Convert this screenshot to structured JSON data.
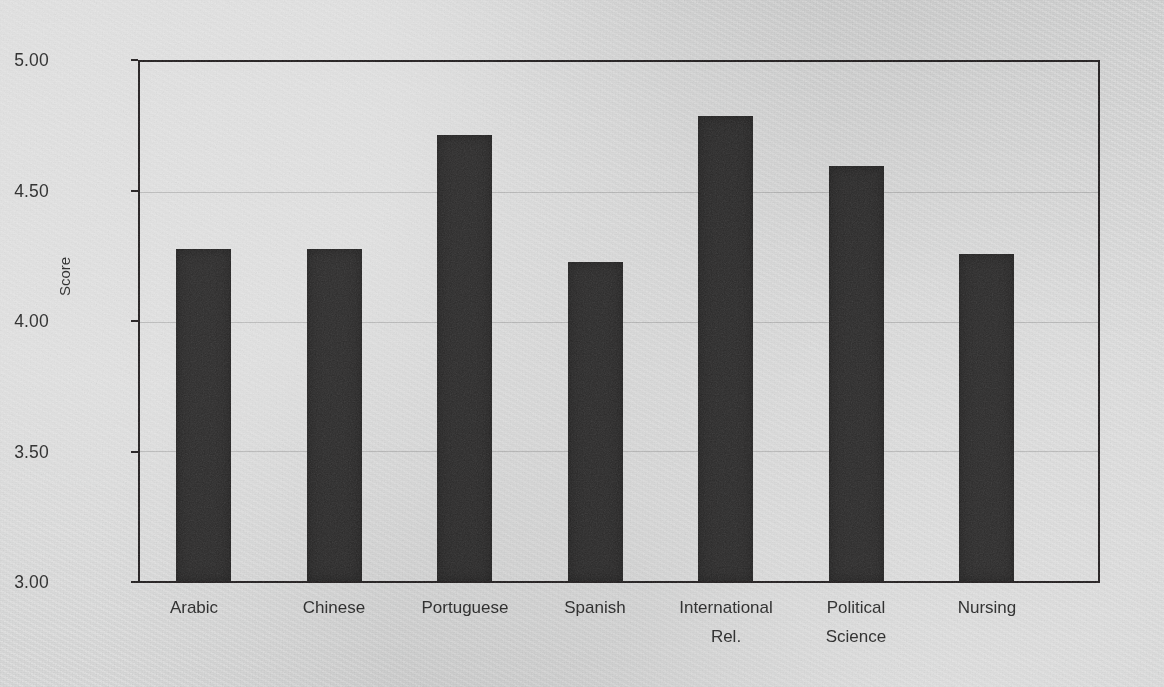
{
  "chart_data": {
    "type": "bar",
    "title": "",
    "subtitle": "",
    "xlabel": "",
    "ylabel": "Score",
    "categories": [
      "Arabic",
      "Chinese",
      "Portuguese",
      "Spanish",
      "International Rel.",
      "Political Science",
      "Nursing"
    ],
    "category_lines": [
      [
        "Arabic"
      ],
      [
        "Chinese"
      ],
      [
        "Portuguese"
      ],
      [
        "Spanish"
      ],
      [
        "International",
        "Rel."
      ],
      [
        "Political",
        "Science"
      ],
      [
        "Nursing"
      ]
    ],
    "values": [
      4.28,
      4.28,
      4.72,
      4.23,
      4.79,
      4.6,
      4.26
    ],
    "ylim": [
      3.0,
      5.0
    ],
    "ytick_labels": [
      "5.00",
      "4.50",
      "4.00",
      "3.50",
      "3.00"
    ],
    "ytick_values": [
      5.0,
      4.5,
      4.0,
      3.5,
      3.0
    ],
    "grid": "horizontal",
    "legend": "none",
    "bar_color": "#2e2d2d",
    "axis_color": "#231f20",
    "grid_color": "#c3c3c3",
    "background_color": "#e9eaea"
  }
}
